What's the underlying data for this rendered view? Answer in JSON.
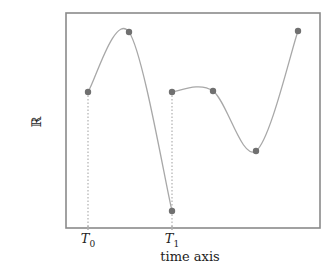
{
  "chart_data": {
    "type": "line",
    "title": "",
    "xlabel": "time axis",
    "ylabel": "ℝ",
    "grid": false,
    "legend": null,
    "x_tick_labels": [
      {
        "main": "T",
        "sub": "0"
      },
      {
        "main": "T",
        "sub": "1"
      }
    ],
    "series": [
      {
        "name": "segment-1",
        "points_px": [
          [
            88,
            92
          ],
          [
            129,
            32
          ],
          [
            172,
            211
          ]
        ]
      },
      {
        "name": "segment-2",
        "points_px": [
          [
            172,
            92
          ],
          [
            213,
            91
          ],
          [
            256,
            151
          ],
          [
            298,
            31
          ]
        ]
      }
    ],
    "dotted_markers": [
      {
        "x": 88,
        "from_y": 92,
        "label": "T0"
      },
      {
        "x": 172,
        "from_y": 92,
        "label": "T1"
      }
    ]
  },
  "frame": {
    "x": 66,
    "y": 13,
    "width": 254,
    "height": 215
  },
  "colors": {
    "frame": "#8a8a8a",
    "curve": "#a8a8a8",
    "point": "#707070",
    "dotted": "#b0b0b0"
  },
  "labels": {
    "y_axis": "ℝ",
    "x_axis": "time axis",
    "t0_main": "T",
    "t0_sub": "0",
    "t1_main": "T",
    "t1_sub": "1"
  }
}
